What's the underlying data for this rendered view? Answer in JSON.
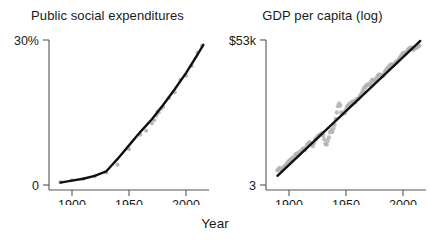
{
  "figure": {
    "shared_xlabel": "Year",
    "background": "#ffffff",
    "point_color": "#b3b3b3",
    "line_color": "#111111",
    "axis_color": "#555555",
    "text_color": "#1a1a1a"
  },
  "chart_data": [
    {
      "type": "scatter",
      "panel": "left",
      "title": "Public social expenditures",
      "xlabel": "Year",
      "ylabel": "",
      "xlim": [
        1880,
        2020
      ],
      "ylim": [
        0,
        30
      ],
      "xticks": [
        1900,
        1950,
        2000
      ],
      "xtick_labels": [
        "1900",
        "1950",
        "2000"
      ],
      "yticks": [
        0,
        30
      ],
      "ytick_labels": [
        "0",
        "30%"
      ],
      "grid": false,
      "legend": "none",
      "series": [
        {
          "name": "Public social expenditures (% of GDP)",
          "marker": "point",
          "color": "#b3b3b3",
          "x": [
            1890,
            1900,
            1910,
            1920,
            1930,
            1940,
            1950,
            1960,
            1965,
            1970,
            1972,
            1974,
            1975,
            1976,
            1978,
            1980,
            1985,
            1990,
            1995,
            2000,
            2005,
            2010,
            2014
          ],
          "y": [
            0.6,
            1.0,
            1.3,
            1.8,
            2.6,
            4.2,
            7.4,
            10.4,
            11.2,
            12.8,
            13.4,
            14.4,
            15.2,
            15.0,
            15.8,
            16.2,
            18.0,
            19.2,
            21.8,
            22.6,
            24.6,
            27.4,
            28.8
          ]
        },
        {
          "name": "fitted trend",
          "marker": "line",
          "color": "#111111",
          "x": [
            1890,
            1900,
            1910,
            1920,
            1930,
            1940,
            1950,
            1960,
            1970,
            1980,
            1990,
            2000,
            2010,
            2015
          ],
          "y": [
            0.5,
            0.9,
            1.3,
            1.9,
            2.8,
            5.4,
            8.2,
            11.0,
            13.6,
            16.6,
            19.8,
            23.2,
            27.0,
            29.0
          ]
        }
      ]
    },
    {
      "type": "scatter",
      "panel": "right",
      "title": "GDP per capita (log)",
      "xlabel": "Year",
      "ylabel": "",
      "xlim": [
        1880,
        2020
      ],
      "ylim": [
        3,
        53
      ],
      "xticks": [
        1900,
        1950,
        2000
      ],
      "xtick_labels": [
        "1900",
        "1950",
        "2000"
      ],
      "yticks": [
        3,
        53
      ],
      "ytick_labels": [
        "3",
        "$53k"
      ],
      "yscale": "log",
      "grid": false,
      "legend": "none",
      "series": [
        {
          "name": "GDP per capita (log scale, annual)",
          "marker": "point",
          "color": "#b3b3b3",
          "x": [
            1890,
            1891,
            1892,
            1893,
            1894,
            1895,
            1896,
            1897,
            1898,
            1899,
            1900,
            1901,
            1902,
            1903,
            1904,
            1905,
            1906,
            1907,
            1908,
            1909,
            1910,
            1911,
            1912,
            1913,
            1914,
            1915,
            1916,
            1917,
            1918,
            1919,
            1920,
            1921,
            1922,
            1923,
            1924,
            1925,
            1926,
            1927,
            1928,
            1929,
            1930,
            1931,
            1932,
            1933,
            1934,
            1935,
            1936,
            1937,
            1938,
            1939,
            1940,
            1941,
            1942,
            1943,
            1944,
            1945,
            1946,
            1947,
            1948,
            1949,
            1950,
            1951,
            1952,
            1953,
            1954,
            1955,
            1956,
            1957,
            1958,
            1959,
            1960,
            1961,
            1962,
            1963,
            1964,
            1965,
            1966,
            1967,
            1968,
            1969,
            1970,
            1971,
            1972,
            1973,
            1974,
            1975,
            1976,
            1977,
            1978,
            1979,
            1980,
            1981,
            1982,
            1983,
            1984,
            1985,
            1986,
            1987,
            1988,
            1989,
            1990,
            1991,
            1992,
            1993,
            1994,
            1995,
            1996,
            1997,
            1998,
            1999,
            2000,
            2001,
            2002,
            2003,
            2004,
            2005,
            2006,
            2007,
            2008,
            2009,
            2010,
            2011,
            2012,
            2013,
            2014
          ],
          "y": [
            4.0,
            4.1,
            4.2,
            4.1,
            4.0,
            4.2,
            4.3,
            4.4,
            4.5,
            4.7,
            4.8,
            4.9,
            5.0,
            5.1,
            5.1,
            5.3,
            5.5,
            5.6,
            5.4,
            5.7,
            5.8,
            5.9,
            6.1,
            6.2,
            6.0,
            6.3,
            6.7,
            6.8,
            7.0,
            6.9,
            6.8,
            6.5,
            6.9,
            7.4,
            7.5,
            7.8,
            8.0,
            8.1,
            8.2,
            8.4,
            8.0,
            7.4,
            6.8,
            6.7,
            7.2,
            7.7,
            8.5,
            8.9,
            8.6,
            9.2,
            9.9,
            11.1,
            12.6,
            14.3,
            15.1,
            14.5,
            12.6,
            12.3,
            12.6,
            12.5,
            13.4,
            14.2,
            14.5,
            15.0,
            14.7,
            15.5,
            15.6,
            15.7,
            15.4,
            16.3,
            16.5,
            16.6,
            17.4,
            17.9,
            18.7,
            19.6,
            20.6,
            20.9,
            21.6,
            22.0,
            21.8,
            22.2,
            23.1,
            24.2,
            23.8,
            23.4,
            24.3,
            25.1,
            26.2,
            26.8,
            26.4,
            26.7,
            25.8,
            26.7,
            28.3,
            29.2,
            30.0,
            30.7,
            31.6,
            32.5,
            32.7,
            32.2,
            32.9,
            33.4,
            34.4,
            35.0,
            35.9,
            37.2,
            38.4,
            39.8,
            41.0,
            40.9,
            41.2,
            42.1,
            43.4,
            44.3,
            45.2,
            45.7,
            45.2,
            43.6,
            44.6,
            45.2,
            46.0,
            46.6,
            47.4
          ]
        },
        {
          "name": "fitted trend",
          "marker": "line",
          "color": "#111111",
          "x": [
            1890,
            2015
          ],
          "y": [
            3.6,
            52.0
          ]
        }
      ]
    }
  ],
  "panels": {
    "left": {
      "title": "Public social expenditures",
      "ytop_label": "30%",
      "ybottom_label": "0",
      "xticks": [
        "1900",
        "1950",
        "2000"
      ]
    },
    "right": {
      "title": "GDP per capita (log)",
      "ytop_label": "$53k",
      "ybottom_label": "3",
      "xticks": [
        "1900",
        "1950",
        "2000"
      ]
    }
  }
}
